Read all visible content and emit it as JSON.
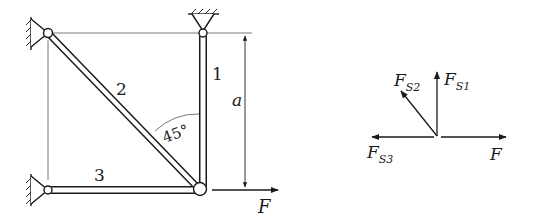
{
  "truss": {
    "members": [
      {
        "id": "1",
        "label": "1"
      },
      {
        "id": "2",
        "label": "2"
      },
      {
        "id": "3",
        "label": "3"
      }
    ],
    "angle_label": "45°",
    "dimension_label": "a",
    "force_label": "F"
  },
  "free_body": {
    "forces": {
      "s1": {
        "main": "F",
        "sub": "S1"
      },
      "s2": {
        "main": "F",
        "sub": "S2"
      },
      "s3": {
        "main": "F",
        "sub": "S3"
      },
      "f": {
        "main": "F"
      }
    }
  },
  "colors": {
    "ink": "#1a1a1a",
    "background": "#ffffff",
    "thin_line": "#555555"
  }
}
